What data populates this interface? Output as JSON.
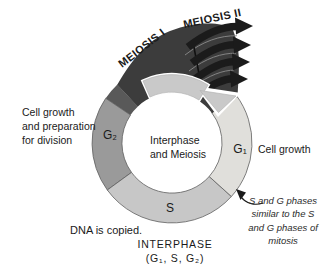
{
  "figure": {
    "band_labels": {
      "meiosis_i": "MEIOSIS I",
      "meiosis_ii": "MEIOSIS II"
    },
    "ring": {
      "g2_label": "G₂",
      "s_label": "S",
      "g1_label": "G₁",
      "center_line1": "Interphase",
      "center_line2": "and Meiosis"
    },
    "captions": {
      "left_lines": [
        "Cell growth",
        "and preparation",
        "for division"
      ],
      "right": "Cell growth",
      "dna": "DNA is copied.",
      "interphase_title": "INTERPHASE",
      "interphase_sub": "(G₁, S, G₂)",
      "note_lines": [
        "S and G phases",
        "similar to the S",
        "and G phases of",
        "mitosis"
      ]
    },
    "colors": {
      "meiosis_band": "#3c3c3c",
      "band_transition": "#595959",
      "arrow_black": "#1b1b1b",
      "g2": "#9a9a9a",
      "s": "#c7c7c7",
      "g1": "#e0dfdb",
      "cycle_arrow": "#c9c9c9"
    }
  }
}
